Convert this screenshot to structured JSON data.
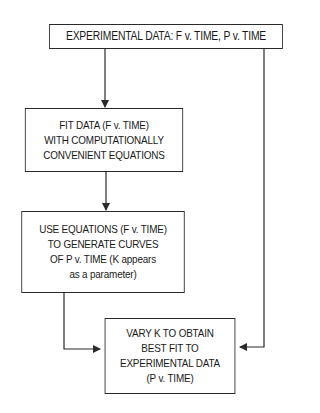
{
  "diagram": {
    "type": "flowchart",
    "nodes": [
      {
        "id": "experimental",
        "lines": [
          "EXPERIMENTAL DATA: F v. TIME, P v. TIME"
        ]
      },
      {
        "id": "fit",
        "lines": [
          "FIT DATA (F v. TIME)",
          "WITH COMPUTATIONALLY",
          "CONVENIENT EQUATIONS"
        ]
      },
      {
        "id": "use",
        "lines": [
          "USE EQUATIONS (F v. TIME)",
          "TO GENERATE CURVES",
          "OF P v. TIME (K appears",
          "as a parameter)"
        ]
      },
      {
        "id": "vary",
        "lines": [
          "VARY K TO OBTAIN",
          "BEST FIT TO",
          "EXPERIMENTAL DATA",
          "(P v. TIME)"
        ]
      }
    ],
    "edges": [
      {
        "from": "experimental",
        "to": "fit"
      },
      {
        "from": "fit",
        "to": "use"
      },
      {
        "from": "use",
        "to": "vary"
      },
      {
        "from": "experimental",
        "to": "vary"
      }
    ],
    "colors": {
      "line": "#2a2a2a",
      "background": "#ffffff"
    }
  }
}
